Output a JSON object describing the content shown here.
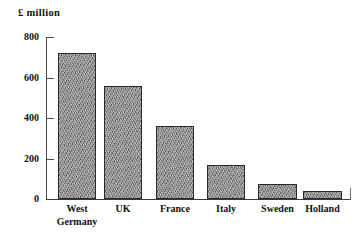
{
  "chart_data": {
    "type": "bar",
    "title": "",
    "ylabel": "£ million",
    "xlabel": "",
    "categories": [
      "West Germany",
      "UK",
      "France",
      "Italy",
      "Sweden",
      "Holland"
    ],
    "values": [
      720,
      560,
      360,
      170,
      75,
      40
    ],
    "ylim": [
      0,
      800
    ],
    "yticks": [
      0,
      200,
      400,
      600,
      800
    ],
    "ytick_labels": [
      "0",
      "200",
      "400",
      "600",
      "800"
    ],
    "grid": false,
    "legend": null,
    "series": [
      {
        "name": "£ million",
        "values": [
          720,
          560,
          360,
          170,
          75,
          40
        ]
      }
    ],
    "bar_fill": "#8e8e8e",
    "bar_border": "#2a2a2a",
    "axis_color": "#3a3a3a",
    "background": "#ffffff"
  },
  "axis": {
    "unit_label": "£ million"
  }
}
